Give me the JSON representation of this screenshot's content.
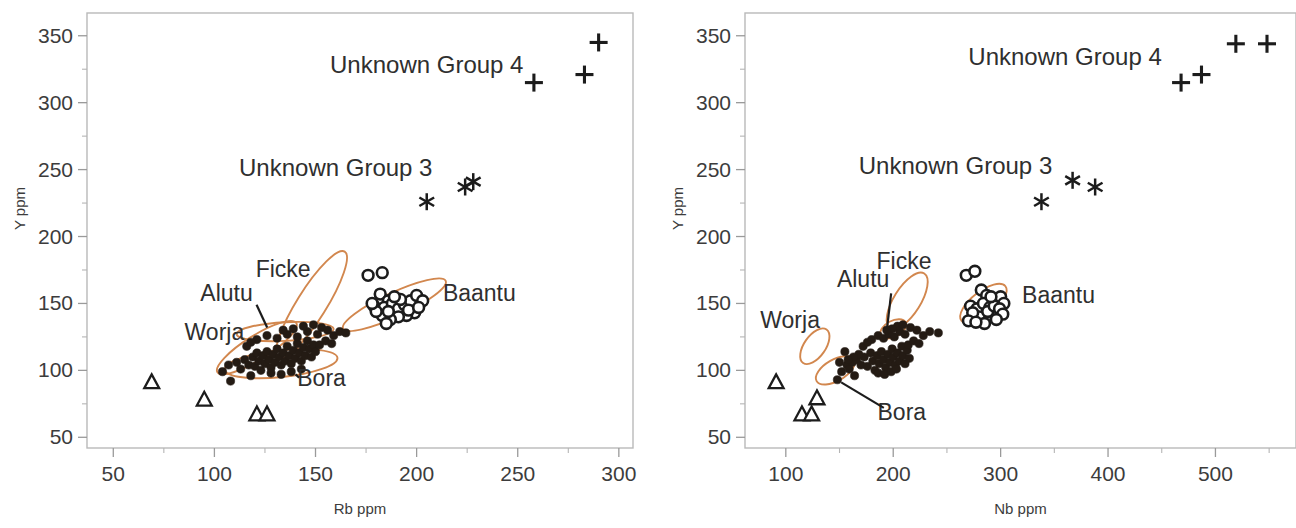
{
  "figure": {
    "panels": [
      {
        "id": "left",
        "xlabel": "Rb ppm",
        "ylabel": "Y ppm",
        "xticks": [
          50,
          100,
          150,
          200,
          250,
          300
        ],
        "yticks": [
          50,
          100,
          150,
          200,
          250,
          300,
          350
        ],
        "xlim": [
          37,
          307
        ],
        "ylim": [
          42,
          367
        ],
        "group_labels": [
          {
            "text": "Unknown Group 4",
            "x": 205,
            "y": 322
          },
          {
            "text": "Unknown Group 3",
            "x": 160,
            "y": 245
          }
        ],
        "cluster_labels": [
          {
            "name": "Ficke",
            "x": 134,
            "y": 170
          },
          {
            "name": "Alutu",
            "x": 106,
            "y": 152
          },
          {
            "name": "Worja",
            "x": 100,
            "y": 123
          },
          {
            "name": "Bora",
            "x": 153,
            "y": 88
          },
          {
            "name": "Baantu",
            "x": 213,
            "y": 152
          }
        ]
      },
      {
        "id": "right",
        "xlabel": "Nb ppm",
        "ylabel": "Y ppm",
        "xticks": [
          100,
          200,
          300,
          400,
          500
        ],
        "yticks": [
          50,
          100,
          150,
          200,
          250,
          300,
          350
        ],
        "xlim": [
          62,
          575
        ],
        "ylim": [
          42,
          367
        ],
        "group_labels": [
          {
            "text": "Unknown Group 4",
            "x": 360,
            "y": 328
          },
          {
            "text": "Unknown Group 3",
            "x": 258,
            "y": 247
          }
        ],
        "cluster_labels": [
          {
            "name": "Ficke",
            "x": 210,
            "y": 176
          },
          {
            "name": "Alutu",
            "x": 172,
            "y": 162
          },
          {
            "name": "Worja",
            "x": 104,
            "y": 132
          },
          {
            "name": "Bora",
            "x": 208,
            "y": 63
          },
          {
            "name": "Baantu",
            "x": 320,
            "y": 150
          }
        ]
      }
    ]
  },
  "colors": {
    "ellipse": "#d2874e",
    "marker_dark": "#241b14",
    "marker_outline": "#1c1c1c",
    "axis": "#b9b9b9",
    "text": "#3a3a3a",
    "background": "#ffffff"
  },
  "chart_data": [
    {
      "type": "scatter",
      "panel": "left",
      "title": "",
      "xlabel": "Rb ppm",
      "ylabel": "Y ppm",
      "xlim": [
        37,
        307
      ],
      "ylim": [
        42,
        367
      ],
      "xticks": [
        50,
        100,
        150,
        200,
        250,
        300
      ],
      "yticks": [
        50,
        100,
        150,
        200,
        250,
        300,
        350
      ],
      "grid": false,
      "legend": "none",
      "series": [
        {
          "name": "Unknown Group 4",
          "marker": "plus",
          "points": [
            [
              258,
              315
            ],
            [
              283,
              321
            ],
            [
              290,
              345
            ]
          ]
        },
        {
          "name": "Unknown Group 3",
          "marker": "star",
          "points": [
            [
              205,
              226
            ],
            [
              224,
              237
            ],
            [
              228,
              241
            ]
          ]
        },
        {
          "name": "Unknown Group 1",
          "marker": "triangle-open",
          "points": [
            [
              69,
              91
            ],
            [
              95,
              78
            ],
            [
              121,
              67
            ],
            [
              126,
              67
            ]
          ]
        },
        {
          "name": "Baantu",
          "marker": "circle-open",
          "points": [
            [
              176,
              171
            ],
            [
              183,
              173
            ],
            [
              182,
              157
            ],
            [
              186,
              152
            ],
            [
              179,
              148
            ],
            [
              184,
              147
            ],
            [
              188,
              150
            ],
            [
              191,
              146
            ],
            [
              194,
              149
            ],
            [
              197,
              152
            ],
            [
              200,
              156
            ],
            [
              203,
              152
            ],
            [
              199,
              143
            ],
            [
              195,
              141
            ],
            [
              191,
              140
            ],
            [
              187,
              138
            ],
            [
              183,
              141
            ],
            [
              180,
              144
            ],
            [
              178,
              150
            ],
            [
              186,
              144
            ],
            [
              192,
              153
            ],
            [
              196,
              145
            ],
            [
              201,
              147
            ],
            [
              189,
              155
            ],
            [
              185,
              135
            ]
          ]
        },
        {
          "name": "Worja / Alutu / Ficke / Bora (filled)",
          "marker": "circle-filled",
          "points": [
            [
              104,
              99
            ],
            [
              107,
              104
            ],
            [
              108,
              92
            ],
            [
              111,
              106
            ],
            [
              113,
              101
            ],
            [
              115,
              108
            ],
            [
              117,
              104
            ],
            [
              118,
              96
            ],
            [
              119,
              110
            ],
            [
              120,
              103
            ],
            [
              121,
              113
            ],
            [
              122,
              107
            ],
            [
              123,
              100
            ],
            [
              124,
              111
            ],
            [
              125,
              105
            ],
            [
              126,
              114
            ],
            [
              127,
              108
            ],
            [
              128,
              102
            ],
            [
              129,
              112
            ],
            [
              130,
              106
            ],
            [
              131,
              116
            ],
            [
              132,
              110
            ],
            [
              133,
              104
            ],
            [
              134,
              113
            ],
            [
              135,
              107
            ],
            [
              136,
              118
            ],
            [
              137,
              111
            ],
            [
              138,
              105
            ],
            [
              139,
              115
            ],
            [
              140,
              109
            ],
            [
              141,
              120
            ],
            [
              142,
              113
            ],
            [
              143,
              107
            ],
            [
              144,
              117
            ],
            [
              145,
              111
            ],
            [
              146,
              122
            ],
            [
              147,
              116
            ],
            [
              148,
              110
            ],
            [
              149,
              119
            ],
            [
              150,
              114
            ],
            [
              128,
              98
            ],
            [
              133,
              97
            ],
            [
              138,
              99
            ],
            [
              143,
              101
            ],
            [
              121,
              123
            ],
            [
              126,
              126
            ],
            [
              131,
              124
            ],
            [
              136,
              127
            ],
            [
              141,
              125
            ],
            [
              146,
              129
            ],
            [
              151,
              127
            ],
            [
              153,
              132
            ],
            [
              156,
              130
            ],
            [
              159,
              126
            ],
            [
              162,
              129
            ],
            [
              165,
              128
            ],
            [
              144,
              133
            ],
            [
              149,
              134
            ],
            [
              139,
              131
            ],
            [
              134,
              130
            ],
            [
              152,
              119
            ],
            [
              155,
              122
            ],
            [
              158,
              120
            ],
            [
              116,
              118
            ],
            [
              118,
              121
            ]
          ]
        }
      ],
      "cluster_ellipses": [
        {
          "name": "Ficke",
          "cx": 148,
          "cy": 149,
          "rx": 31,
          "ry": 11,
          "angle": -58
        },
        {
          "name": "Alutu",
          "cx": 135,
          "cy": 129,
          "rx": 24,
          "ry": 7,
          "angle": -3
        },
        {
          "name": "Worja",
          "cx": 121,
          "cy": 117,
          "rx": 23,
          "ry": 9,
          "angle": -32
        },
        {
          "name": "Bora",
          "cx": 133,
          "cy": 105,
          "rx": 28,
          "ry": 10,
          "angle": -6
        },
        {
          "name": "Baantu",
          "cx": 189,
          "cy": 149,
          "rx": 28,
          "ry": 9,
          "angle": -25
        }
      ]
    },
    {
      "type": "scatter",
      "panel": "right",
      "title": "",
      "xlabel": "Nb ppm",
      "ylabel": "Y ppm",
      "xlim": [
        62,
        575
      ],
      "ylim": [
        42,
        367
      ],
      "xticks": [
        100,
        200,
        300,
        400,
        500
      ],
      "yticks": [
        50,
        100,
        150,
        200,
        250,
        300,
        350
      ],
      "grid": false,
      "legend": "none",
      "series": [
        {
          "name": "Unknown Group 4",
          "marker": "plus",
          "points": [
            [
              468,
              315
            ],
            [
              487,
              321
            ],
            [
              519,
              344
            ],
            [
              548,
              344
            ]
          ]
        },
        {
          "name": "Unknown Group 3",
          "marker": "star",
          "points": [
            [
              338,
              226
            ],
            [
              367,
              242
            ],
            [
              388,
              237
            ]
          ]
        },
        {
          "name": "Unknown Group 1",
          "marker": "triangle-open",
          "points": [
            [
              91,
              91
            ],
            [
              129,
              79
            ],
            [
              115,
              67
            ],
            [
              124,
              67
            ]
          ]
        },
        {
          "name": "Baantu",
          "marker": "circle-open",
          "points": [
            [
              268,
              171
            ],
            [
              276,
              174
            ],
            [
              282,
              160
            ],
            [
              287,
              156
            ],
            [
              272,
              148
            ],
            [
              278,
              146
            ],
            [
              284,
              150
            ],
            [
              290,
              147
            ],
            [
              295,
              152
            ],
            [
              300,
              155
            ],
            [
              303,
              150
            ],
            [
              298,
              143
            ],
            [
              292,
              141
            ],
            [
              286,
              139
            ],
            [
              280,
              140
            ],
            [
              274,
              143
            ],
            [
              270,
              137
            ],
            [
              288,
              144
            ],
            [
              294,
              148
            ],
            [
              299,
              146
            ],
            [
              302,
              142
            ],
            [
              291,
              155
            ],
            [
              285,
              135
            ],
            [
              277,
              136
            ],
            [
              296,
              138
            ]
          ]
        },
        {
          "name": "Worja / Alutu / Ficke / Bora (filled)",
          "marker": "circle-filled",
          "points": [
            [
              152,
              99
            ],
            [
              157,
              104
            ],
            [
              148,
              93
            ],
            [
              162,
              106
            ],
            [
              159,
              101
            ],
            [
              166,
              108
            ],
            [
              170,
              104
            ],
            [
              164,
              96
            ],
            [
              173,
              110
            ],
            [
              176,
              103
            ],
            [
              179,
              113
            ],
            [
              181,
              107
            ],
            [
              183,
              100
            ],
            [
              185,
              111
            ],
            [
              187,
              105
            ],
            [
              189,
              114
            ],
            [
              191,
              108
            ],
            [
              193,
              102
            ],
            [
              195,
              112
            ],
            [
              197,
              106
            ],
            [
              199,
              116
            ],
            [
              200,
              110
            ],
            [
              202,
              104
            ],
            [
              204,
              113
            ],
            [
              206,
              107
            ],
            [
              208,
              118
            ],
            [
              209,
              111
            ],
            [
              211,
              105
            ],
            [
              213,
              115
            ],
            [
              215,
              109
            ],
            [
              186,
              98
            ],
            [
              192,
              97
            ],
            [
              198,
              99
            ],
            [
              203,
              101
            ],
            [
              180,
              123
            ],
            [
              186,
              126
            ],
            [
              191,
              124
            ],
            [
              196,
              127
            ],
            [
              201,
              125
            ],
            [
              206,
              129
            ],
            [
              211,
              127
            ],
            [
              216,
              132
            ],
            [
              222,
              130
            ],
            [
              228,
              126
            ],
            [
              234,
              129
            ],
            [
              242,
              128
            ],
            [
              204,
              133
            ],
            [
              209,
              134
            ],
            [
              199,
              131
            ],
            [
              194,
              130
            ],
            [
              214,
              119
            ],
            [
              219,
              122
            ],
            [
              224,
              120
            ],
            [
              172,
              118
            ],
            [
              176,
              121
            ],
            [
              168,
              112
            ],
            [
              163,
              110
            ],
            [
              158,
              108
            ],
            [
              155,
              114
            ],
            [
              150,
              106
            ]
          ]
        }
      ],
      "cluster_ellipses": [
        {
          "name": "Ficke",
          "cx": 213,
          "cy": 152,
          "rx": 30,
          "ry": 10,
          "angle": -58
        },
        {
          "name": "Alutu",
          "cx": 200,
          "cy": 131,
          "rx": 13,
          "ry": 6,
          "angle": -28
        },
        {
          "name": "Worja",
          "cx": 127,
          "cy": 118,
          "rx": 19,
          "ry": 8,
          "angle": -55
        },
        {
          "name": "Bora",
          "cx": 146,
          "cy": 100,
          "rx": 20,
          "ry": 8,
          "angle": -30
        },
        {
          "name": "Baantu",
          "cx": 284,
          "cy": 150,
          "rx": 26,
          "ry": 9,
          "angle": -38
        }
      ]
    }
  ]
}
